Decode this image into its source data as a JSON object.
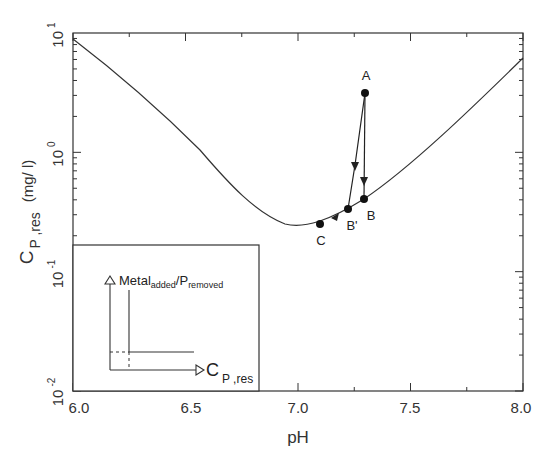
{
  "chart_data": {
    "type": "line",
    "title": "",
    "xlabel": "pH",
    "ylabel": "C P,res (mg/l)",
    "yscale": "log",
    "xlim": [
      6.0,
      8.0
    ],
    "ylim": [
      0.01,
      10
    ],
    "x_ticks": [
      "6.0",
      "6.5",
      "7.0",
      "7.5",
      "8.0"
    ],
    "y_ticks": [
      {
        "base": "10",
        "exp": "1"
      },
      {
        "base": "10",
        "exp": "0"
      },
      {
        "base": "10",
        "exp": "-1"
      },
      {
        "base": "10",
        "exp": "-2"
      }
    ],
    "grid": false,
    "series": [
      {
        "name": "solubility curve",
        "x": [
          6.0,
          6.39,
          6.8,
          7.0,
          7.3,
          7.63,
          8.0
        ],
        "y": [
          8.9,
          2.5,
          0.31,
          0.24,
          0.41,
          1.55,
          6.2
        ]
      },
      {
        "name": "path A-B",
        "x": [
          7.3,
          7.3
        ],
        "y": [
          3.1,
          0.41
        ]
      },
      {
        "name": "path A-B'-C",
        "x": [
          7.3,
          7.22,
          7.1
        ],
        "y": [
          3.1,
          0.33,
          0.25
        ]
      }
    ],
    "points": [
      {
        "label": "A",
        "x": 7.3,
        "y": 3.1
      },
      {
        "label": "B",
        "x": 7.3,
        "y": 0.41
      },
      {
        "label": "B'",
        "x": 7.22,
        "y": 0.33
      },
      {
        "label": "C",
        "x": 7.1,
        "y": 0.25
      }
    ],
    "inset": {
      "y_label_main": "Metal",
      "y_label_sub1": "added",
      "y_label_slash": "/P",
      "y_label_sub2": "removed",
      "x_label_main": "C",
      "x_label_sub": "P ,res"
    }
  },
  "axis": {
    "ylabel_main": "C",
    "ylabel_sub": "P ,res",
    "ylabel_unit": "(mg/ l)",
    "xlabel": "pH"
  },
  "labels": {
    "A": "A",
    "B": "B",
    "Bp": "B'",
    "C": "C"
  }
}
